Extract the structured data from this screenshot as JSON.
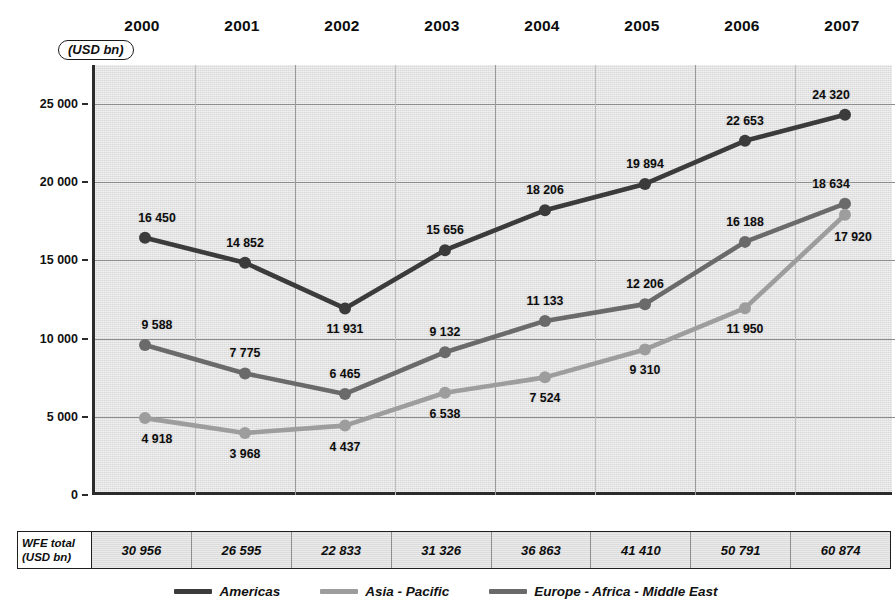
{
  "unit_badge": "(USD bn)",
  "axis": {
    "y_ticks": [
      "25 000",
      "20 000",
      "15 000",
      "10 000",
      "5 000",
      "0"
    ],
    "y_tick_values": [
      25000,
      20000,
      15000,
      10000,
      5000,
      0
    ]
  },
  "total_row": {
    "header_line1": "WFE total",
    "header_line2": "(USD bn)",
    "values": [
      "30 956",
      "26 595",
      "22 833",
      "31 326",
      "36 863",
      "41 410",
      "50 791",
      "60 874"
    ]
  },
  "legend": [
    {
      "label": "Americas",
      "color": "#3b3b3b"
    },
    {
      "label": "Asia - Pacific",
      "color": "#9d9d9d"
    },
    {
      "label": "Europe - Africa - Middle East",
      "color": "#6a6a6a"
    }
  ],
  "chart_data": {
    "type": "line",
    "title": "",
    "subtitle": "",
    "xlabel": "",
    "ylabel": "USD bn",
    "ylim": [
      0,
      27500
    ],
    "grid": true,
    "legend_position": "bottom",
    "categories": [
      "2000",
      "2001",
      "2002",
      "2003",
      "2004",
      "2005",
      "2006",
      "2007"
    ],
    "series": [
      {
        "name": "Americas",
        "color": "#3b3b3b",
        "values": [
          16450,
          14852,
          11931,
          15656,
          18206,
          19894,
          22653,
          24320
        ],
        "labels": [
          "16 450",
          "14 852",
          "11 931",
          "15 656",
          "18 206",
          "19 894",
          "22 653",
          "24 320"
        ],
        "label_pos": [
          "above",
          "above",
          "below",
          "above",
          "above",
          "above",
          "above",
          "above"
        ]
      },
      {
        "name": "Europe - Africa - Middle East",
        "color": "#6a6a6a",
        "values": [
          9588,
          7775,
          6465,
          9132,
          11133,
          12206,
          16188,
          18634
        ],
        "labels": [
          "9 588",
          "7 775",
          "6 465",
          "9 132",
          "11 133",
          "12 206",
          "16 188",
          "18 634"
        ],
        "label_pos": [
          "above",
          "above",
          "above",
          "above",
          "above",
          "above",
          "above",
          "above"
        ]
      },
      {
        "name": "Asia - Pacific",
        "color": "#9d9d9d",
        "values": [
          4918,
          3968,
          4437,
          6538,
          7524,
          9310,
          11950,
          17920
        ],
        "labels": [
          "4 918",
          "3 968",
          "4 437",
          "6 538",
          "7 524",
          "9 310",
          "11 950",
          "17 920"
        ],
        "label_pos": [
          "below",
          "below",
          "below",
          "below",
          "below",
          "below",
          "below",
          "below-right"
        ]
      }
    ],
    "totals": {
      "name": "WFE total (USD bn)",
      "values": [
        30956,
        26595,
        22833,
        31326,
        36863,
        41410,
        50791,
        60874
      ]
    }
  }
}
